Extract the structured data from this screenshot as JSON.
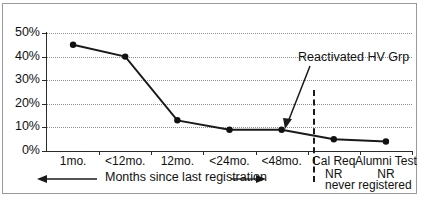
{
  "chart_data": {
    "type": "line",
    "title": "",
    "xlabel": "Months since last registration",
    "ylabel": "",
    "ylim": [
      0,
      50
    ],
    "grid": true,
    "legend": "none",
    "categories": [
      "1mo.",
      "<12mo.",
      "12mo.",
      "<24mo.",
      "<48mo.",
      "Cal Req",
      "Alumni Test"
    ],
    "category_sublabels": [
      "",
      "",
      "",
      "",
      "",
      "NR",
      "NR"
    ],
    "values": [
      45,
      40,
      13,
      9,
      9,
      5,
      4
    ],
    "ytick_labels": [
      "0%",
      "10%",
      "20%",
      "30%",
      "40%",
      "50%"
    ],
    "ytick_values": [
      0,
      10,
      20,
      30,
      40,
      50
    ],
    "annotations": [
      {
        "text": "Reactivated HV Grp",
        "points_to_category": "<48mo.",
        "points_to_value": 9
      },
      {
        "text": "never registered",
        "kind": "group-label"
      },
      {
        "text": "Months since last registration",
        "kind": "axis-span-label"
      }
    ],
    "divider": {
      "kind": "dashed-vertical",
      "between": [
        "<48mo.",
        "Cal Req"
      ]
    },
    "colors": {
      "line": "#1a1a1a",
      "marker": "#111111",
      "grid": "#8d8d8d",
      "axis": "#2a2a2a",
      "frame": "#9a9a9a",
      "background": "#ffffff"
    }
  }
}
